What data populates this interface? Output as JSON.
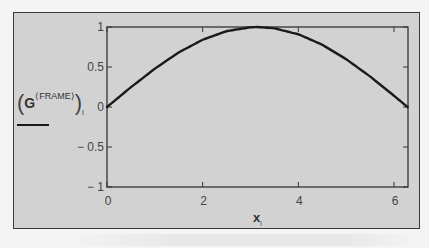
{
  "chart_data": {
    "type": "line",
    "title": "",
    "xlabel": "x_i",
    "ylabel": "(G^(FRAME))_i",
    "xlim": [
      0,
      6.2832
    ],
    "ylim": [
      -1,
      1
    ],
    "x_ticks": [
      0,
      2,
      4,
      6
    ],
    "y_ticks": [
      -1,
      -0.5,
      0,
      0.5,
      1
    ],
    "x_tick_labels": [
      "0",
      "2",
      "4",
      "6"
    ],
    "y_tick_labels": [
      "− 1",
      "− 0.5",
      "0",
      "0.5",
      "1"
    ],
    "grid": false,
    "legend_position": "left",
    "series": [
      {
        "name": "(G^(FRAME))_i",
        "color": "#1a1a1a",
        "x": [
          0,
          0.5,
          1.0,
          1.5,
          2.0,
          2.5,
          3.0,
          3.1416,
          3.5,
          4.0,
          4.5,
          5.0,
          5.5,
          6.0,
          6.2832
        ],
        "y": [
          0,
          0.247,
          0.479,
          0.682,
          0.841,
          0.949,
          0.997,
          1.0,
          0.984,
          0.909,
          0.778,
          0.598,
          0.381,
          0.141,
          0
        ]
      }
    ]
  },
  "legend": {
    "open_paren": "(",
    "symbol": "G",
    "superscript": "⟨FRAME⟩",
    "close_paren": ")",
    "subscript": "i"
  },
  "axis_label_x": {
    "symbol": "x",
    "subscript": "i"
  },
  "colors": {
    "frame_bg": "#d2d2d2",
    "page_bg": "#f4f4f4",
    "line": "#1a1a1a",
    "axis": "#333333"
  }
}
